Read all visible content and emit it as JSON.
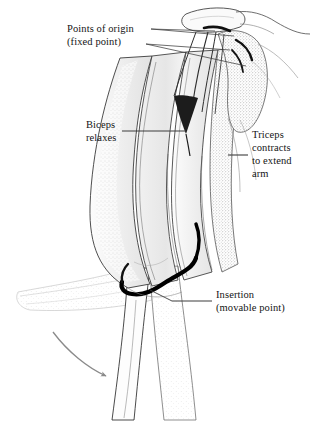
{
  "figure": {
    "background_color": "#ffffff",
    "ink_color": "#141414",
    "muscle_fill": "#ececec",
    "muscle_fill_light": "#f4f4f4",
    "stipple_color": "#8c8c8c",
    "tendon_color": "#000000",
    "arrow_color": "#8a8a8a",
    "leader_color": "#3c3c3c"
  },
  "labels": {
    "points_of_origin": {
      "line1": "Points of origin",
      "line2": "(fixed point)"
    },
    "biceps": {
      "line1": "Biceps",
      "line2": "relaxes"
    },
    "triceps": {
      "line1": "Triceps",
      "line2": "contracts",
      "line3": "to extend",
      "line4": "arm"
    },
    "insertion": {
      "line1": "Insertion",
      "line2": "(movable point)"
    }
  },
  "annotations": {
    "motion_arrow": "curved arrow indicating forearm extending downward"
  }
}
